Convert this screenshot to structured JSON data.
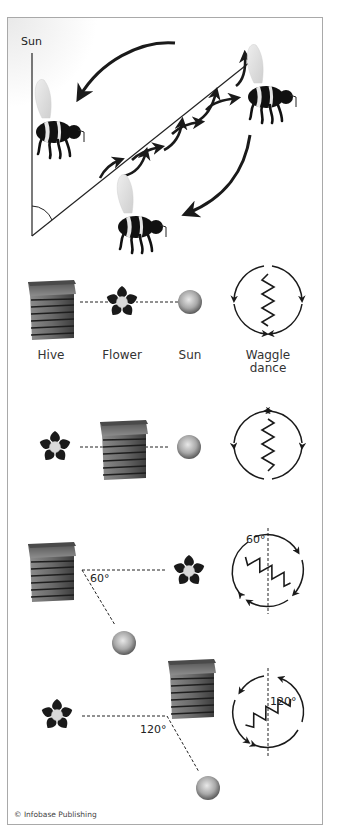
{
  "diagram": {
    "title_label": "Sun",
    "legend": {
      "hive": "Hive",
      "flower": "Flower",
      "sun": "Sun",
      "waggle_line1": "Waggle",
      "waggle_line2": "dance"
    },
    "scenarios": [
      {
        "id": 1,
        "layout": "hive - flower - sun in a line",
        "waggle_direction": "up",
        "angle": null
      },
      {
        "id": 2,
        "layout": "flower - hive - sun in a line",
        "waggle_direction": "down",
        "angle": null
      },
      {
        "id": 3,
        "layout": "hive to flower at 60 degrees from sun",
        "waggle_direction": "60 degrees from vertical",
        "angle_label": "60°",
        "dance_angle_label": "60°"
      },
      {
        "id": 4,
        "layout": "hive to flower at 120 degrees from sun",
        "waggle_direction": "120 degrees from vertical",
        "angle_label": "120°",
        "dance_angle_label": "120°"
      }
    ],
    "colors": {
      "frame": "#a9a9a9",
      "ink": "#1a1a1a",
      "sun_gray": "#9a9a9a"
    },
    "copyright": "© Infobase Publishing"
  }
}
